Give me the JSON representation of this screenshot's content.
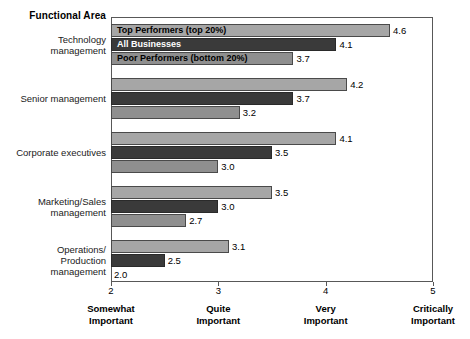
{
  "chart_data": {
    "type": "bar",
    "orientation": "horizontal",
    "title": "",
    "axis_title": "Functional Area",
    "xlabel": "",
    "ylabel": "Functional Area",
    "xlim": [
      2,
      5
    ],
    "grid": false,
    "legend_position": "overlaid-on-first-group",
    "categories": [
      "Technology management",
      "Senior management",
      "Corporate executives",
      "Marketing/Sales management",
      "Operations/ Production management"
    ],
    "category_lines": [
      [
        "Technology",
        "management"
      ],
      [
        "Senior management"
      ],
      [
        "Corporate executives"
      ],
      [
        "Marketing/Sales",
        "management"
      ],
      [
        "Operations/",
        "Production",
        "management"
      ]
    ],
    "series": [
      {
        "name": "Top Performers (top 20%)",
        "color": "#a6a6a6",
        "values": [
          4.6,
          4.2,
          4.1,
          3.5,
          3.1
        ],
        "labels": [
          "4.6",
          "4.2",
          "4.1",
          "3.5",
          "3.1"
        ]
      },
      {
        "name": "All Businesses",
        "color": "#3a3a3a",
        "values": [
          4.1,
          3.7,
          3.5,
          3.0,
          2.5
        ],
        "labels": [
          "4.1",
          "3.7",
          "3.5",
          "3.0",
          "2.5"
        ]
      },
      {
        "name": "Poor Performers (bottom 20%)",
        "color": "#8f8f8f",
        "values": [
          3.7,
          3.2,
          3.0,
          2.7,
          2.0
        ],
        "labels": [
          "3.7",
          "3.2",
          "3.0",
          "2.7",
          "2.0"
        ]
      }
    ],
    "x_ticks": [
      {
        "value": 2,
        "label": "2",
        "caption_lines": [
          "Somewhat",
          "Important"
        ]
      },
      {
        "value": 3,
        "label": "3",
        "caption_lines": [
          "Quite",
          "Important"
        ]
      },
      {
        "value": 4,
        "label": "4",
        "caption_lines": [
          "Very",
          "Important"
        ]
      },
      {
        "value": 5,
        "label": "5",
        "caption_lines": [
          "Critically",
          "Important"
        ]
      }
    ]
  }
}
